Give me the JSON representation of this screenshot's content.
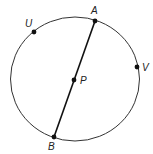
{
  "diagram": {
    "type": "circle-with-chord",
    "circle": {
      "cx": 75,
      "cy": 79,
      "rx": 64.5,
      "ry": 62,
      "stroke": "#333333"
    },
    "segment": {
      "from": "A",
      "to": "B",
      "stroke": "#111111"
    },
    "points": [
      {
        "id": "A",
        "label": "A",
        "x": 95,
        "y": 21,
        "lx": 91,
        "ly": 14
      },
      {
        "id": "U",
        "label": "U",
        "x": 34,
        "y": 32,
        "lx": 25,
        "ly": 26
      },
      {
        "id": "V",
        "label": "V",
        "x": 137,
        "y": 67,
        "lx": 142,
        "ly": 71
      },
      {
        "id": "P",
        "label": "P",
        "x": 74,
        "y": 80,
        "lx": 80,
        "ly": 84
      },
      {
        "id": "B",
        "label": "B",
        "x": 54,
        "y": 137,
        "lx": 49,
        "ly": 150
      }
    ]
  }
}
